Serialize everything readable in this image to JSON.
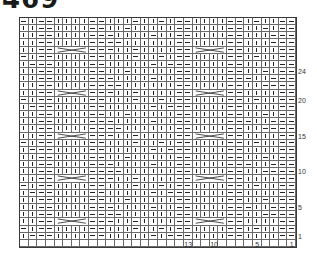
{
  "title": "469",
  "legend_symbols": {
    "K": "knit (vertical bar)",
    "P": "purl (horizontal dash)",
    "C": "4-stitch cable cross"
  },
  "chart": {
    "columns": 32,
    "pattern_rows": 31,
    "column_labels": [
      {
        "label": "13",
        "stitch": 13
      },
      {
        "label": "10",
        "stitch": 10
      },
      {
        "label": "5",
        "stitch": 5
      },
      {
        "label": "1",
        "stitch": 1
      }
    ],
    "row_labels": [
      {
        "label": "24",
        "row": 24
      },
      {
        "label": "20",
        "row": 20
      },
      {
        "label": "15",
        "row": 15
      },
      {
        "label": "10",
        "row": 10
      },
      {
        "label": "5",
        "row": 5
      },
      {
        "label": "1",
        "row": 1
      }
    ],
    "cable_rows": [
      3,
      9,
      15,
      21,
      27
    ],
    "cable_columns_from_left": [
      4,
      20
    ],
    "rows_top_to_bottom": [
      "PKPPKKKKPPKKKPKKPKPPKKKKPPKPKKPP",
      "KKPPKKKKPPKKPKKKKKPPKKKKPPKKPKPP",
      "KKPPKKKKPPPKKKKPKKPPKKKKPPKKKPPP",
      "KKPPKKKKPPPPKKKKKKPPKKKKPPKKKPPP",
      "KKPPCCCCPPPKKPKKKKPPCCCCPPKKKKPP",
      "PKPPKKKKPPKKKPKKPKPPKKKKPPKPKKPP",
      "KPPPKKKKPPKKKKKPKPPPKKKKPPKKKKPP",
      "KKPPKKKKPPKKPKKKKKPPKKKKPPKKPKPP",
      "KKPPKKKKPPPKKKKPKKPPKKKKPPPKKPPP",
      "KKPPKKKKPPPPKKKKKKPPKKKKPPKKPPPP",
      "KKPPCCCCPPPKKPKKKKPPCCCCPPKKKKPP",
      "PKPPKKKKPPKKKPKKPKPPKKKKPPKPKKPP",
      "KPPPKKKKPPKKKKKPKPPPKKKKPPKKKKPP",
      "KKPPKKKKPPKKPKKKKKPPKKKKPPKKPKPP",
      "KKPPKKKKPPPKKKKPKKPPKKKKPPPKKPPP",
      "KKPPKKKKPPPPKKKKKKPPKKKKPPKKPPPP",
      "KKPPCCCCPPPKKPKKKKPPCCCCPPKKKKPP",
      "PKPPKKKKPPKKKPKKPKPPKKKKPPKPKKPP",
      "KPPPKKKKPPKKKKKPKPPPKKKKPPKKKKPP",
      "KKPPKKKKPPKKPKKKKKPPKKKKPPKKPKPP",
      "KKPPKKKKPPPKKKKPKKPPKKKKPPPKKPPP",
      "KKPPKKKKPPPPKKKKKKPPKKKKPPKKPPPP",
      "KKPPCCCCPPPKKPKKKKPPCCCCPPKKKKPP",
      "PKPPKKKKPPKKKPKKPKPPKKKKPPKPKKPP",
      "KPPPKKKKPPKKKKKPKPPPKKKKPPKKKKPP",
      "KKPPKKKKPPKKPKKKKKPPKKKKPPKKPKPP",
      "KKPPKKKKPPPKKKKPKKPPKKKKPPPKKPPP",
      "KKPPKKKKPPPPKKKKKKPPKKKKPPKKPPPP",
      "KKPPCCCCPPPKKPKKKKPPCCCCPPKKKKPP",
      "PKPPKKKKPPKKKPKKPKPPKKKKPPKPKKPP",
      "KPPPKKKKPPKKKKKPKPPPKKKKPPKKKKPP"
    ]
  }
}
